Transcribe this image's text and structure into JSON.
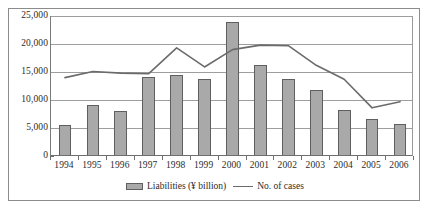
{
  "chart_data": {
    "type": "bar",
    "title": "",
    "subtitle": "",
    "xlabel": "",
    "ylabel": "",
    "ylim": [
      0,
      25000
    ],
    "ytick_labels": [
      "0",
      "5,000",
      "10,000",
      "15,000",
      "20,000",
      "25,000"
    ],
    "ytick_values": [
      0,
      5000,
      10000,
      15000,
      20000,
      25000
    ],
    "grid": true,
    "legend_position": "bottom-center",
    "categories": [
      "1994",
      "1995",
      "1996",
      "1997",
      "1998",
      "1999",
      "2000",
      "2001",
      "2002",
      "2003",
      "2004",
      "2005",
      "2006"
    ],
    "series": [
      {
        "name": "Liabilities (¥ billion)",
        "type": "bar",
        "color": "#a9a9a9",
        "edge_color": "#5f5f5f",
        "values": [
          5500,
          9100,
          8100,
          14100,
          14400,
          13700,
          24000,
          16200,
          13800,
          11800,
          8200,
          6600,
          5700
        ]
      },
      {
        "name": "No. of cases",
        "type": "line",
        "color": "#6b6b6b",
        "values": [
          14000,
          15100,
          14800,
          14700,
          19300,
          15900,
          19000,
          19800,
          19700,
          16200,
          13700,
          8600,
          9700
        ]
      }
    ]
  },
  "legend": {
    "entries": [
      {
        "label": "Liabilities (¥ billion)",
        "marker": "bar-swatch"
      },
      {
        "label": "No. of cases",
        "marker": "line-swatch"
      }
    ]
  }
}
